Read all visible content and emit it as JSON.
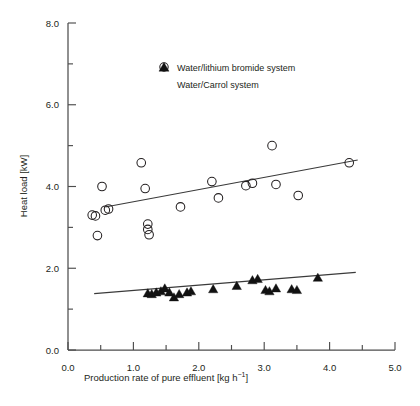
{
  "chart_data": {
    "type": "scatter",
    "title": "",
    "xlabel": "Production rate of pure effluent [kg h⁻¹]",
    "ylabel": "Heat load [kW]",
    "xlim": [
      0.0,
      5.0
    ],
    "ylim": [
      0.0,
      8.0
    ],
    "xticks": [
      "0.0",
      "1.0",
      "2.0",
      "3.0",
      "4.0",
      "5.0"
    ],
    "xtick_values": [
      0.0,
      1.0,
      2.0,
      3.0,
      4.0,
      5.0
    ],
    "xminor_step": 0.5,
    "yticks": [
      "0.0",
      "2.0",
      "4.0",
      "6.0",
      "8.0"
    ],
    "ytick_values": [
      0.0,
      2.0,
      4.0,
      6.0,
      8.0
    ],
    "yminor_step": 1.0,
    "grid": false,
    "legend_position": "top-center",
    "series": [
      {
        "name": "Water/lithium bromide system",
        "marker": "open-circle",
        "color": "#231f20",
        "points": [
          [
            0.37,
            3.3
          ],
          [
            0.42,
            3.28
          ],
          [
            0.45,
            2.8
          ],
          [
            0.52,
            4.0
          ],
          [
            0.57,
            3.42
          ],
          [
            0.62,
            3.45
          ],
          [
            1.12,
            4.58
          ],
          [
            1.18,
            3.95
          ],
          [
            1.22,
            3.08
          ],
          [
            1.22,
            2.95
          ],
          [
            1.24,
            2.82
          ],
          [
            1.72,
            3.5
          ],
          [
            2.2,
            4.12
          ],
          [
            2.3,
            3.72
          ],
          [
            2.72,
            4.02
          ],
          [
            2.82,
            4.08
          ],
          [
            3.12,
            5.0
          ],
          [
            3.18,
            4.05
          ],
          [
            3.52,
            3.78
          ],
          [
            4.3,
            4.58
          ]
        ],
        "trendline": {
          "x0": 0.57,
          "y0": 3.5,
          "x1": 4.43,
          "y1": 4.65
        }
      },
      {
        "name": "Water/Carrol system",
        "marker": "filled-triangle",
        "color": "#111111",
        "points": [
          [
            1.22,
            1.4
          ],
          [
            1.28,
            1.38
          ],
          [
            1.35,
            1.42
          ],
          [
            1.42,
            1.45
          ],
          [
            1.48,
            1.52
          ],
          [
            1.55,
            1.42
          ],
          [
            1.62,
            1.3
          ],
          [
            1.7,
            1.38
          ],
          [
            1.82,
            1.42
          ],
          [
            1.88,
            1.45
          ],
          [
            2.22,
            1.5
          ],
          [
            2.58,
            1.58
          ],
          [
            2.82,
            1.72
          ],
          [
            2.9,
            1.75
          ],
          [
            3.02,
            1.48
          ],
          [
            3.08,
            1.45
          ],
          [
            3.18,
            1.52
          ],
          [
            3.42,
            1.5
          ],
          [
            3.5,
            1.48
          ],
          [
            3.82,
            1.78
          ]
        ],
        "trendline": {
          "x0": 0.4,
          "y0": 1.38,
          "x1": 4.4,
          "y1": 1.9
        }
      }
    ]
  },
  "axes": {
    "y_title": "Heat load [kW]",
    "x_title_main": "Production rate of pure effluent [kg h",
    "x_title_sup": "−1",
    "x_title_end": "]"
  },
  "legend": {
    "items": [
      {
        "label": "Water/lithium bromide system",
        "marker": "open-circle"
      },
      {
        "label": "Water/Carrol system",
        "marker": "filled-triangle"
      }
    ]
  }
}
